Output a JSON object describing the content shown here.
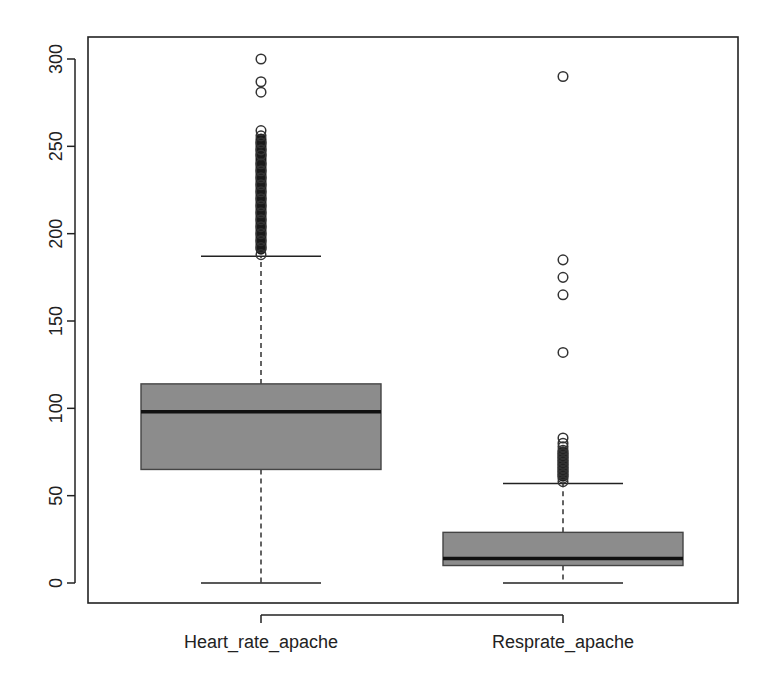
{
  "chart_data": {
    "type": "boxplot",
    "title": "",
    "xlabel": "",
    "ylabel": "",
    "ylim": [
      -12,
      312
    ],
    "yticks": [
      0,
      50,
      100,
      150,
      200,
      250,
      300
    ],
    "grid": false,
    "legend": null,
    "box_fill": "#8c8c8c",
    "line_color": "#222222",
    "categories": [
      "Heart_rate_apache",
      "Resprate_apache"
    ],
    "series": [
      {
        "name": "Heart_rate_apache",
        "whisker_low": 0,
        "q1": 65,
        "median": 98,
        "q3": 114,
        "whisker_high": 187,
        "outliers": [
          300,
          287,
          281,
          259,
          256,
          252,
          248,
          245,
          240,
          236,
          232,
          228,
          224,
          220,
          216,
          212,
          208,
          204,
          200,
          196,
          192,
          188
        ],
        "outliers_dense_range": [
          188,
          259
        ]
      },
      {
        "name": "Resprate_apache",
        "whisker_low": 0,
        "q1": 10,
        "median": 14,
        "q3": 29,
        "whisker_high": 57,
        "outliers": [
          290,
          185,
          175,
          165,
          132,
          83,
          80,
          78,
          76,
          74,
          72,
          70,
          68,
          66,
          64,
          62,
          60,
          58
        ],
        "outliers_dense_range": [
          58,
          80
        ]
      }
    ]
  },
  "axis": {
    "y_tick_labels": [
      "0",
      "50",
      "100",
      "150",
      "200",
      "250",
      "300"
    ],
    "x_tick_labels": [
      "Heart_rate_apache",
      "Resprate_apache"
    ]
  }
}
